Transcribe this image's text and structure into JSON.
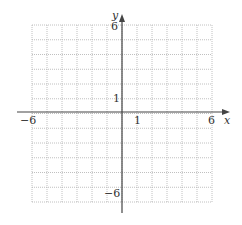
{
  "chart_data": {
    "type": "coordinate-grid",
    "title": "",
    "xlabel": "x",
    "ylabel": "y",
    "xlim": [
      -6,
      6
    ],
    "ylim": [
      -6,
      6
    ],
    "grid": true,
    "grid_style": "dotted",
    "tick_labels": {
      "x": [
        "-6",
        "1",
        "6"
      ],
      "y": [
        "6",
        "1",
        "-6"
      ]
    },
    "series": []
  },
  "labels": {
    "x_axis": "x",
    "y_axis": "y",
    "x_min": "−6",
    "x_one": "1",
    "x_max": "6",
    "y_max": "6",
    "y_one": "1",
    "y_min": "−6"
  },
  "colors": {
    "axis": "#444444",
    "grid": "#b0b0b0",
    "text": "#333333"
  }
}
